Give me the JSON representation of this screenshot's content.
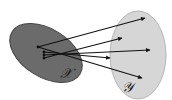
{
  "diagram": {
    "sets": [
      {
        "id": "X",
        "label": "𝒳",
        "fill": "#6b6b6b",
        "stroke": "#3a3a3a"
      },
      {
        "id": "Y",
        "label": "𝒴",
        "fill": "#d6d6d6",
        "stroke": "#b0b0b0"
      }
    ],
    "arrow_color": "#111111",
    "arrows": [
      {
        "from": "x1",
        "to": "y1"
      },
      {
        "from": "x2",
        "to": "y2"
      },
      {
        "from": "x3",
        "to": "y3"
      },
      {
        "from": "x4",
        "to": "y4"
      },
      {
        "from": "x1",
        "to": "y5"
      }
    ]
  }
}
